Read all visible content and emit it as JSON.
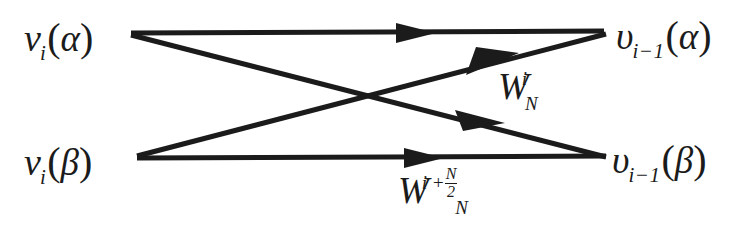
{
  "figure": {
    "type": "radix-2 FFT butterfly signal flow graph",
    "background_color": "#ffffff",
    "ink_color": "#1b1b1b",
    "width": 746,
    "height": 227
  },
  "nodes": {
    "top_left": {
      "base": "v",
      "subscript": "i",
      "open_paren": "(",
      "argument": "α",
      "close_paren": ")",
      "full": "v_i(α)"
    },
    "bottom_left": {
      "base": "v",
      "subscript": "i",
      "open_paren": "(",
      "argument": "β",
      "close_paren": ")",
      "full": "v_i(β)"
    },
    "top_right": {
      "base": "υ",
      "subscript": "i−1",
      "open_paren": "(",
      "argument": "α",
      "close_paren": ")",
      "full": "υ_{i-1}(α)"
    },
    "bottom_right": {
      "base": "υ",
      "subscript": "i−1",
      "open_paren": "(",
      "argument": "β",
      "close_paren": ")",
      "full": "υ_{i-1}(β)"
    }
  },
  "edge_labels": {
    "twiddle_top": {
      "base": "W",
      "subscript": "N",
      "superscript": "i",
      "full": "W_N^i"
    },
    "twiddle_bottom": {
      "base": "W",
      "subscript": "N",
      "superscript_term": "i +",
      "superscript_fraction_numerator": "N",
      "superscript_fraction_denominator": "2",
      "full": "W_N^{i + N/2}"
    }
  },
  "edges": [
    {
      "name": "top-straight-edge",
      "from": "top_left",
      "to": "top_right",
      "label": null
    },
    {
      "name": "bottom-straight-edge",
      "from": "bottom_left",
      "to": "bottom_right",
      "label": null
    },
    {
      "name": "cross-edge-up",
      "from": "bottom_left",
      "to": "top_right",
      "label": "W_N^i"
    },
    {
      "name": "cross-edge-down",
      "from": "top_left",
      "to": "bottom_right",
      "label": "W_N^{i + N/2}"
    }
  ]
}
